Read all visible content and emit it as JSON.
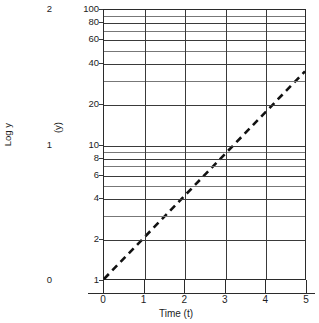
{
  "chart_data": {
    "type": "line",
    "title": "",
    "xlabel": "Time (t)",
    "ylabel_primary": "Log y",
    "ylabel_secondary": "(y)",
    "xlim": [
      0,
      5
    ],
    "ylim": [
      1,
      100
    ],
    "yscale": "log",
    "grid": true,
    "legend": "none",
    "x_ticks": [
      {
        "value": 0,
        "label": "0"
      },
      {
        "value": 1,
        "label": "1"
      },
      {
        "value": 2,
        "label": "2"
      },
      {
        "value": 3,
        "label": "3"
      },
      {
        "value": 4,
        "label": "4"
      },
      {
        "value": 5,
        "label": "5"
      }
    ],
    "y_ticks_labeled": [
      {
        "value": 100,
        "label": "100"
      },
      {
        "value": 80,
        "label": "80"
      },
      {
        "value": 60,
        "label": "60"
      },
      {
        "value": 40,
        "label": "40"
      },
      {
        "value": 20,
        "label": "20"
      },
      {
        "value": 10,
        "label": "10"
      },
      {
        "value": 8,
        "label": "8"
      },
      {
        "value": 6,
        "label": "6"
      },
      {
        "value": 4,
        "label": "4"
      },
      {
        "value": 2,
        "label": "2"
      },
      {
        "value": 1,
        "label": "1"
      }
    ],
    "y_gridlines_unlabeled": [
      90,
      70,
      50,
      30,
      9,
      7,
      5,
      3
    ],
    "logy_ticks": [
      {
        "value": 100,
        "label": "2"
      },
      {
        "value": 10,
        "label": "1"
      },
      {
        "value": 1,
        "label": "0"
      }
    ],
    "series": [
      {
        "name": "exponential-trend",
        "style": "dashed",
        "color": "#111111",
        "x": [
          0,
          5
        ],
        "y": [
          1,
          35
        ]
      }
    ],
    "annotations": []
  }
}
